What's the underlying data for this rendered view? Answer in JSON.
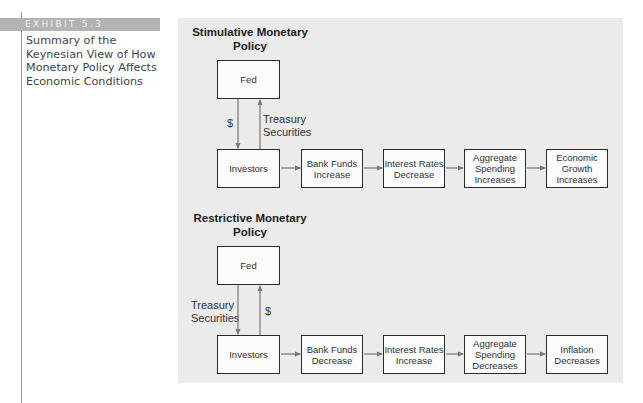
{
  "sidebar": {
    "exhibit_label": "EXHIBIT 5.3",
    "caption": "Summary of the Keynesian View of How Monetary Policy Affects Economic Conditions"
  },
  "stimulative": {
    "title_line1": "Stimulative Monetary",
    "title_line2": "Policy",
    "fed": "Fed",
    "down_arrow_label": "$",
    "up_arrow_label_line1": "Treasury",
    "up_arrow_label_line2": "Securities",
    "chain": [
      {
        "line1": "Investors",
        "line2": "",
        "line3": ""
      },
      {
        "line1": "Bank Funds",
        "line2": "Increase",
        "line3": ""
      },
      {
        "line1": "Interest Rates",
        "line2": "Decrease",
        "line3": ""
      },
      {
        "line1": "Aggregate",
        "line2": "Spending",
        "line3": "Increases"
      },
      {
        "line1": "Economic",
        "line2": "Growth",
        "line3": "Increases"
      }
    ]
  },
  "restrictive": {
    "title_line1": "Restrictive Monetary",
    "title_line2": "Policy",
    "fed": "Fed",
    "down_arrow_label_line1": "Treasury",
    "down_arrow_label_line2": "Securities",
    "up_arrow_label": "$",
    "chain": [
      {
        "line1": "Investors",
        "line2": "",
        "line3": ""
      },
      {
        "line1": "Bank Funds",
        "line2": "Decrease",
        "line3": ""
      },
      {
        "line1": "Interest Rates",
        "line2": "Increase",
        "line3": ""
      },
      {
        "line1": "Aggregate",
        "line2": "Spending",
        "line3": "Decreases"
      },
      {
        "line1": "Inflation",
        "line2": "Decreases",
        "line3": ""
      }
    ]
  }
}
